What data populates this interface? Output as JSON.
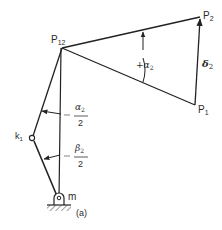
{
  "figure": {
    "caption": "(a)",
    "points": {
      "pole": {
        "label": "P",
        "sub": "12"
      },
      "p1": {
        "label": "P",
        "sub": "1"
      },
      "p2": {
        "label": "P",
        "sub": "2"
      },
      "crank_joint": {
        "label": "k",
        "sub": "1"
      },
      "ground_pivot": {
        "label": "m"
      }
    },
    "angles": {
      "rotation": {
        "sign": "+",
        "symbol": "α",
        "sub": "2"
      },
      "half_alpha": {
        "symbol": "α",
        "sub": "2",
        "denominator": "2"
      },
      "half_beta": {
        "symbol": "β",
        "sub": "2",
        "denominator": "2"
      }
    },
    "displacement": {
      "symbol": "δ",
      "sub": "2"
    }
  }
}
